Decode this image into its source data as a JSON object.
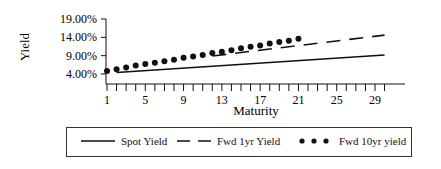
{
  "chart_data": {
    "type": "line",
    "title": "",
    "xlabel": "Maturity",
    "ylabel": "Yield",
    "ylim": [
      4.0,
      19.0
    ],
    "xlim": [
      1,
      30
    ],
    "y_ticks": [
      "19.00%",
      "14.00%",
      "9.00%",
      "4.00%"
    ],
    "y_tick_values": [
      19,
      14,
      9,
      4
    ],
    "x_ticks": [
      "1",
      "5",
      "9",
      "13",
      "17",
      "21",
      "25",
      "29"
    ],
    "x_tick_values": [
      1,
      5,
      9,
      13,
      17,
      21,
      25,
      29
    ],
    "grid": false,
    "legend_position": "bottom",
    "series": [
      {
        "name": "Spot Yield",
        "style": "solid",
        "x": [
          2,
          30
        ],
        "values": [
          4.4,
          9.2
        ]
      },
      {
        "name": "Fwd 1yr Yield",
        "style": "dashed",
        "x": [
          12,
          30
        ],
        "values": [
          8.9,
          14.6
        ]
      },
      {
        "name": "Fwd 10yr yield",
        "style": "dots",
        "x": [
          1,
          2,
          3,
          4,
          5,
          6,
          7,
          8,
          9,
          10,
          11,
          12,
          13,
          14,
          15,
          16,
          17,
          18,
          19,
          20,
          21
        ],
        "values": [
          4.8,
          5.3,
          5.8,
          6.3,
          6.7,
          7.1,
          7.5,
          7.9,
          8.4,
          8.8,
          9.2,
          9.7,
          10.1,
          10.5,
          11.0,
          11.4,
          11.8,
          12.3,
          12.7,
          13.1,
          13.6
        ]
      }
    ]
  },
  "legend": {
    "spot": "Spot Yield",
    "fwd1": "Fwd 1yr Yield",
    "fwd10": "Fwd 10yr yield"
  },
  "colors": {
    "line": "#111111"
  }
}
